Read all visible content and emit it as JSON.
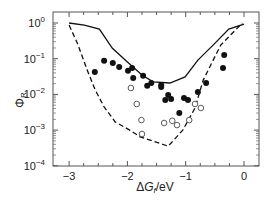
{
  "chart_data": {
    "type": "scatter",
    "title": "",
    "xlabel": "ΔG_f /eV",
    "ylabel": "Φ_R",
    "xlim": [
      -3.2,
      0.25
    ],
    "ylim_log10": [
      -4,
      0.1
    ],
    "yscale": "log",
    "x_ticks": [
      -3,
      -2,
      -1,
      0
    ],
    "x_tick_labels": [
      "−3",
      "−2",
      "−1",
      "0"
    ],
    "y_ticks_log10": [
      0,
      -1,
      -2,
      -3,
      -4
    ],
    "y_tick_labels": [
      "10",
      "10",
      "10",
      "10",
      "10"
    ],
    "y_tick_exponents": [
      "0",
      "−1",
      "−2",
      "−3",
      "−4"
    ],
    "grid": false,
    "legend": null,
    "series": [
      {
        "name": "upper bound (solid)",
        "style": "line-solid",
        "points": [
          [
            -3.0,
            0.0
          ],
          [
            -2.74,
            -0.06
          ],
          [
            -2.48,
            -0.17
          ],
          [
            -2.26,
            -0.7
          ],
          [
            -2.0,
            -1.09
          ],
          [
            -1.75,
            -1.46
          ],
          [
            -1.56,
            -1.65
          ],
          [
            -1.27,
            -1.68
          ],
          [
            -1.01,
            -1.51
          ],
          [
            -0.79,
            -1.04
          ],
          [
            -0.53,
            -0.62
          ],
          [
            -0.26,
            -0.17
          ],
          [
            0.0,
            -0.03
          ]
        ]
      },
      {
        "name": "lower bound (dashed)",
        "style": "line-dashed",
        "points": [
          [
            -3.0,
            -0.06
          ],
          [
            -2.86,
            -0.56
          ],
          [
            -2.69,
            -1.32
          ],
          [
            -2.55,
            -1.88
          ],
          [
            -2.4,
            -2.35
          ],
          [
            -2.21,
            -2.77
          ],
          [
            -1.96,
            -3.0
          ],
          [
            -1.78,
            -3.19
          ],
          [
            -1.3,
            -3.45
          ],
          [
            -1.05,
            -3.0
          ],
          [
            -0.84,
            -2.38
          ],
          [
            -0.7,
            -1.6
          ],
          [
            -0.4,
            -0.62
          ],
          [
            -0.03,
            0.0
          ]
        ]
      },
      {
        "name": "filled circles",
        "style": "marker-filled",
        "points": [
          [
            -2.56,
            -1.37
          ],
          [
            -2.4,
            -1.06
          ],
          [
            -2.25,
            -1.12
          ],
          [
            -2.14,
            -1.23
          ],
          [
            -1.99,
            -1.34
          ],
          [
            -1.92,
            -1.26
          ],
          [
            -1.9,
            -1.54
          ],
          [
            -1.73,
            -1.48
          ],
          [
            -1.66,
            -1.76
          ],
          [
            -1.59,
            -1.68
          ],
          [
            -1.42,
            -1.74
          ],
          [
            -1.42,
            -1.79
          ],
          [
            -1.35,
            -2.16
          ],
          [
            -1.3,
            -2.02
          ],
          [
            -1.25,
            -2.13
          ],
          [
            -1.03,
            -2.1
          ],
          [
            -0.96,
            -2.16
          ],
          [
            -1.11,
            -2.52
          ],
          [
            -0.79,
            -1.93
          ],
          [
            -0.65,
            -1.68
          ],
          [
            -0.36,
            -1.26
          ],
          [
            -0.34,
            -0.9
          ]
        ]
      },
      {
        "name": "open circles",
        "style": "marker-open",
        "points": [
          [
            -1.94,
            -1.82
          ],
          [
            -1.84,
            -2.27
          ],
          [
            -1.76,
            -2.72
          ],
          [
            -1.75,
            -3.11
          ],
          [
            -1.37,
            -2.8
          ],
          [
            -1.23,
            -2.74
          ],
          [
            -1.15,
            -2.86
          ],
          [
            -0.94,
            -2.72
          ],
          [
            -0.84,
            -2.27
          ],
          [
            -0.74,
            -2.38
          ]
        ]
      }
    ]
  }
}
